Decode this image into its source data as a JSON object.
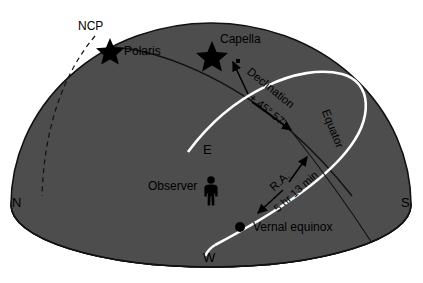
{
  "diagram": {
    "colors": {
      "background": "#ffffff",
      "dome": "#4d4d4d",
      "ground": "#a8a8a8",
      "outline": "#111111",
      "equator": "#ffffff",
      "text": "#000000"
    }
  },
  "labels": {
    "ncp": "NCP",
    "polaris": "Polaris",
    "capella": "Capella",
    "declination": "Declination",
    "declination_value": "+ 45° 57'",
    "equator": "Equator",
    "ra": "R.A.",
    "ra_value": "5 hr 13 min",
    "vernal_equinox": "Vernal equinox",
    "observer": "Observer",
    "north": "N",
    "south": "S",
    "east": "E",
    "west": "W"
  },
  "icons": {
    "polaris_star": "star-icon",
    "capella_star": "star-icon",
    "observer_figure": "person-icon",
    "vernal_equinox_point": "dot-icon",
    "declination_arrow": "double-arrow-icon",
    "ra_arrow": "double-arrow-icon"
  }
}
